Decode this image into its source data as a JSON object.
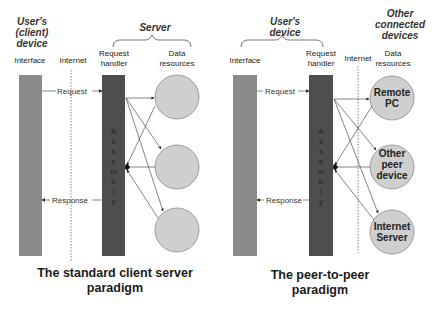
{
  "left_panel": {
    "group_user": "User's (client) device",
    "group_user_lines": [
      "User's",
      "(client)",
      "device"
    ],
    "group_server": "Server",
    "col_interface": "Interface",
    "col_internet": "Internet",
    "col_handler_lines": [
      "Request",
      "handler"
    ],
    "col_data_lines": [
      "Data",
      "resources"
    ],
    "request_label": "Request",
    "response_label": "Response",
    "assembly_letters": [
      "A",
      "s",
      "s",
      "e",
      "m",
      "b",
      "l",
      "y"
    ],
    "resources": [
      "",
      "",
      ""
    ],
    "title_lines": [
      "The standard client server",
      "paradigm"
    ]
  },
  "right_panel": {
    "group_user_lines": [
      "User's",
      "device"
    ],
    "group_other_lines": [
      "Other",
      "connected",
      "devices"
    ],
    "col_interface": "Interface",
    "col_handler_lines": [
      "Request",
      "handler"
    ],
    "col_internet": "Internet",
    "col_data_lines": [
      "Data",
      "resources"
    ],
    "request_label": "Request",
    "response_label": "Response",
    "assembly_letters": [
      "A",
      "s",
      "s",
      "e",
      "m",
      "b",
      "l",
      "y"
    ],
    "resources": [
      {
        "lines": [
          "Remote",
          "PC"
        ]
      },
      {
        "lines": [
          "Other",
          "peer",
          "device"
        ]
      },
      {
        "lines": [
          "Internet",
          "Server"
        ]
      }
    ],
    "title_lines": [
      "The peer-to-peer",
      "paradigm"
    ]
  },
  "colors": {
    "interface_bar": "#8a8a8a",
    "handler_bar": "#4e4e4e",
    "circle_fill": "#cfcfcf",
    "circle_stroke": "#8a8a8a",
    "arrow": "#333333"
  }
}
